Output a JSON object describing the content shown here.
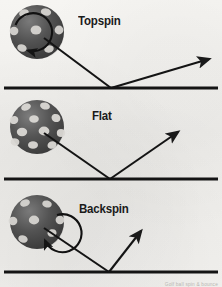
{
  "figure": {
    "background_color": "#f2f1ee",
    "ink_color": "#1a1a1a",
    "ball_color": "#4c4c4c",
    "dimple_color": "#d8d6d2"
  },
  "caption": "Golf ball spin & bounce",
  "panels": [
    {
      "id": "topspin",
      "label": "Topspin",
      "label_x": 78,
      "label_y": 14,
      "ball": {
        "cx": 37,
        "cy": 32,
        "r": 27,
        "has_spin_arrow": true,
        "spin_direction": "clockwise",
        "spin_label": "forward rotation"
      },
      "ground": {
        "x1": 4,
        "x2": 218,
        "y": 88
      },
      "incoming": {
        "x1": 44,
        "y1": 38,
        "x2": 111,
        "y2": 88
      },
      "outgoing": {
        "x1": 111,
        "y1": 88,
        "x2": 212,
        "y2": 58
      },
      "rebound_angle_deg": 17,
      "rebound_description": "low, shallow skidding bounce"
    },
    {
      "id": "flat",
      "label": "Flat",
      "label_x": 92,
      "label_y": 109,
      "ball": {
        "cx": 37,
        "cy": 127,
        "r": 27,
        "has_spin_arrow": false,
        "spin_direction": "none",
        "spin_label": "no rotation"
      },
      "ground": {
        "x1": 4,
        "x2": 218,
        "y": 179
      },
      "incoming": {
        "x1": 44,
        "y1": 133,
        "x2": 110,
        "y2": 179
      },
      "outgoing": {
        "x1": 110,
        "y1": 179,
        "x2": 181,
        "y2": 130
      },
      "rebound_angle_deg": 35,
      "rebound_description": "symmetric equal-angle bounce"
    },
    {
      "id": "backspin",
      "label": "Backspin",
      "label_x": 79,
      "label_y": 202,
      "ball": {
        "cx": 37,
        "cy": 222,
        "r": 27,
        "has_spin_arrow": true,
        "spin_direction": "counterclockwise",
        "spin_label": "reverse rotation"
      },
      "ground": {
        "x1": 4,
        "x2": 218,
        "y": 272
      },
      "incoming": {
        "x1": 44,
        "y1": 228,
        "x2": 109,
        "y2": 272
      },
      "outgoing": {
        "x1": 109,
        "y1": 272,
        "x2": 143,
        "y2": 228
      },
      "rebound_angle_deg": 52,
      "rebound_description": "steep, high checking bounce"
    }
  ]
}
